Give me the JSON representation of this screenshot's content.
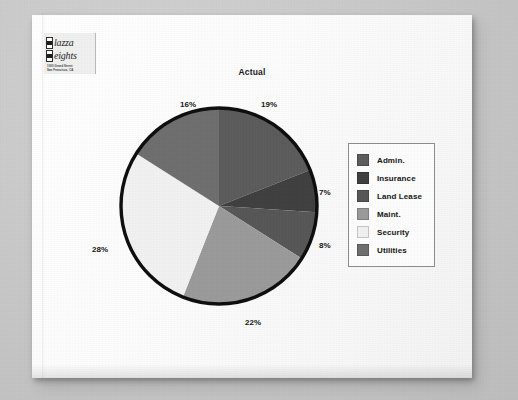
{
  "document": {
    "logo": {
      "line1": "lazza",
      "line2": "eights",
      "address_line1": "1000 Grand Street",
      "address_line2": "San Francisco, CA"
    }
  },
  "chart_data": {
    "type": "pie",
    "title": "Actual",
    "categories": [
      "Admin.",
      "Insurance",
      "Land Lease",
      "Maint.",
      "Security",
      "Utilities"
    ],
    "values": [
      19,
      7,
      8,
      22,
      28,
      16
    ],
    "value_labels": [
      "19%",
      "7%",
      "8%",
      "22%",
      "28%",
      "16%"
    ],
    "colors": [
      "#5b5b5b",
      "#3f3f3f",
      "#565656",
      "#9a9a9a",
      "#f1f1f1",
      "#6e6e6e"
    ],
    "legend_position": "right",
    "grid": false,
    "start_angle_deg": 0,
    "direction": "clockwise",
    "outline_color": "#0d0d0d",
    "labels": {
      "admin": "19%",
      "insurance": "7%",
      "land_lease": "8%",
      "maint": "22%",
      "security": "28%",
      "utilities": "16%"
    }
  },
  "legend": {
    "items": [
      {
        "label": "Admin.",
        "color": "#5b5b5b"
      },
      {
        "label": "Insurance",
        "color": "#3f3f3f"
      },
      {
        "label": "Land Lease",
        "color": "#565656"
      },
      {
        "label": "Maint.",
        "color": "#9a9a9a"
      },
      {
        "label": "Security",
        "color": "#f1f1f1"
      },
      {
        "label": "Utilities",
        "color": "#6e6e6e"
      }
    ]
  }
}
